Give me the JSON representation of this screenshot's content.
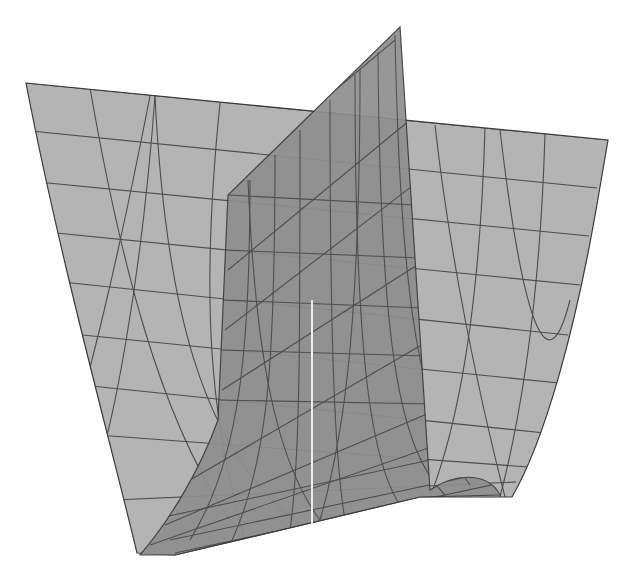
{
  "figure": {
    "type": "3d-surface-mesh",
    "colors": {
      "background": "#ffffff",
      "outer_surface": "#b4b4b4",
      "inner_surface": "#8f8f8f",
      "mesh_line": "#3a3a3a",
      "seam": "#f2f2f2"
    },
    "outer_surface": {
      "outline": "M26,83 L608,140 L596,210 C575,330 545,440 512,497 L420,497 L175,555 L137,553 C110,440 60,260 26,83 Z",
      "rows": [
        [
          [
            26,
            83
          ],
          [
            608,
            140
          ]
        ],
        [
          [
            31,
            131
          ],
          [
            597,
            188
          ]
        ],
        [
          [
            38,
            182
          ],
          [
            589,
            236
          ]
        ],
        [
          [
            46,
            232
          ],
          [
            580,
            285
          ]
        ],
        [
          [
            53,
            281
          ],
          [
            568,
            335
          ]
        ],
        [
          [
            63,
            333
          ],
          [
            559,
            383
          ]
        ],
        [
          [
            72,
            384
          ],
          [
            545,
            433
          ]
        ],
        [
          [
            84,
            434
          ],
          [
            529,
            467
          ]
        ],
        [
          [
            115,
            500
          ],
          [
            516,
            482
          ]
        ]
      ],
      "cols": [
        "M90,88 C120,260 160,420 230,520",
        "M155,96 C165,300 200,450 300,525",
        "M220,103 C200,300 210,420 245,540",
        "M485,128 C480,300 460,420 430,497",
        "M545,134 C540,300 520,420 500,497",
        "M150,96 C120,250 85,400 70,430",
        "M155,96 C140,300 110,430 100,460",
        "M500,130 C520,300 545,400 570,300",
        "M435,125 C450,260 480,400 505,497"
      ]
    },
    "inner_surface": {
      "outline": "M400,27 L430,490 C460,470 490,475 500,495 L420,497 L175,555 L140,555 C170,520 200,470 218,420 L228,195 L400,27 Z",
      "apex": [
        400,
        27
      ],
      "seam": "M312,300 L312,525",
      "rows": [
        [
          [
            228,
            195
          ],
          [
            415,
            205
          ]
        ],
        [
          [
            225,
            250
          ],
          [
            420,
            258
          ]
        ],
        [
          [
            222,
            300
          ],
          [
            424,
            308
          ]
        ],
        [
          [
            220,
            350
          ],
          [
            428,
            356
          ]
        ],
        [
          [
            218,
            400
          ],
          [
            432,
            404
          ]
        ],
        [
          [
            150,
            520
          ],
          [
            430,
            460
          ]
        ],
        [
          [
            170,
            540
          ],
          [
            500,
            470
          ]
        ],
        [
          [
            175,
            553
          ],
          [
            505,
            482
          ]
        ]
      ],
      "diagonals": [
        "M228,270 L410,120",
        "M225,330 L420,180",
        "M222,390 L425,260",
        "M190,480 L430,340",
        "M165,525 L460,400",
        "M150,545 L480,430",
        "M240,170 L395,40"
      ],
      "cols": [
        "M250,180 C250,350 240,460 190,540",
        "M275,155 C275,350 270,460 230,545",
        "M300,130 C300,350 300,460 290,530",
        "M330,100 C330,350 335,460 345,520",
        "M355,75 C355,350 370,460 400,505",
        "M378,52 C380,350 400,450 445,495",
        "M248,180 C255,350 275,460 320,520",
        "M360,70 C360,350 340,450 320,520",
        "M395,35 C400,300 420,420 470,485"
      ]
    },
    "bleed_through_text": [
      "3.4 Wiederholung der Grenzwerte",
      "und Stetigkeit im Mehrdimensionalen"
    ]
  }
}
